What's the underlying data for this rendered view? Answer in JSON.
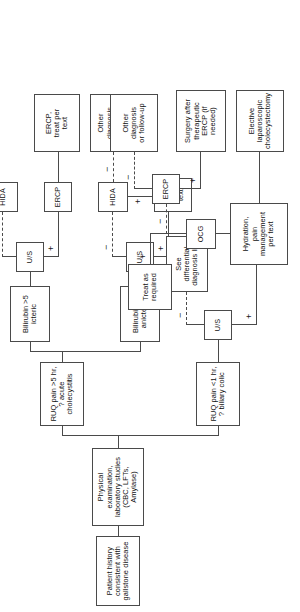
{
  "diagram": {
    "orientation": "rotated-90-ccw",
    "nodes": {
      "patient_history": "Patient history consistent with\ngallstone disease",
      "physical_exam": "Physical examination, laboratory studies\n(CBC, LFTs, Amylase)",
      "ruq_short": "RUQ pain <1 hr,\n? biliary colic",
      "ruq_long": "RUQ pain >5 hr,\n? acute cholecystitis",
      "bilirubin_high": "Bilirubin >5\nicteric",
      "bilirubin_low": "Bilirubin <5\nanicteric",
      "us_colic": "U/S",
      "us_high": "U/S",
      "us_low": "U/S",
      "hida_high": "HIDA",
      "hida_low": "HIDA",
      "ercp_high": "ERCP",
      "ercp_colic": "ERCP",
      "ocg": "OCG",
      "see_differential": "See differential\ndiagnosis list",
      "treat_as_required": "Treat as\nrequired",
      "treat_per_text": "Treat\nper\ntext",
      "other_dx_1": "Other\ndiagnosis\nor follow-up",
      "other_dx_2": "Other\ndiagnosis\nor\nfollow-up",
      "other_dx_3": "Other\ndiagnosis\nor follow-up",
      "ercp_treat_per_text": "ERCP,\ntreat per\ntext",
      "surgery_after_ercp": "Surgery after\ntherapeutic\nERCP (if needed)",
      "hydration_pain": "Hydration,\npain\nmanagement\nper text",
      "elective_lap_chole": "Elective\nlaparoscopic\ncholecystectomy"
    },
    "edge_labels": {
      "plus": "+",
      "minus": "−"
    }
  }
}
